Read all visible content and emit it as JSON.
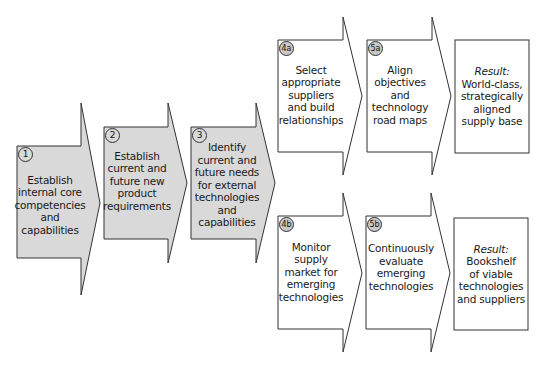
{
  "colors": {
    "shaded_fill": "#d9d9d9",
    "white_fill": "#ffffff",
    "stroke": "#333333",
    "badge_fill": "#c8c8c8"
  },
  "steps": [
    {
      "id": "1",
      "badge": "1",
      "text": "Establish\ninternal core\ncompetencies\nand\ncapabilities"
    },
    {
      "id": "2",
      "badge": "2",
      "text": "Establish\ncurrent and\nfuture new\nproduct\nrequirements"
    },
    {
      "id": "3",
      "badge": "3",
      "text": "Identify\ncurrent and\nfuture needs\nfor external\ntechnologies\nand\ncapabilities"
    },
    {
      "id": "4a",
      "badge": "4a",
      "text": "Select\nappropriate\nsuppliers\nand build\nrelationships"
    },
    {
      "id": "5a",
      "badge": "5a",
      "text": "Align\nobjectives\nand\ntechnology\nroad maps"
    },
    {
      "id": "4b",
      "badge": "4b",
      "text": "Monitor\nsupply\nmarket for\nemerging\ntechnologies"
    },
    {
      "id": "5b",
      "badge": "5b",
      "text": "Continuously\nevaluate\nemerging\ntechnologies"
    }
  ],
  "results": [
    {
      "label": "Result:",
      "text": "World-class,\nstrategically\naligned\nsupply base"
    },
    {
      "label": "Result:",
      "text": "Bookshelf\nof viable\ntechnologies\nand suppliers"
    }
  ]
}
